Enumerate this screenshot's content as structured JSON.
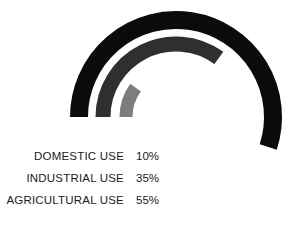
{
  "chart_data": {
    "type": "bar",
    "variant": "radial-bar",
    "title": "",
    "subtitle": "",
    "xlabel": "",
    "ylabel": "",
    "categories": [
      "DOMESTIC USE",
      "INDUSTRIAL USE",
      "AGRICULTURAL USE"
    ],
    "values": [
      10,
      35,
      55
    ],
    "value_labels": [
      "10%",
      "35%",
      "55%"
    ],
    "unit": "%",
    "ylim": [
      0,
      100
    ],
    "grid": false,
    "legend_position": "left",
    "series": [
      {
        "name": "DOMESTIC USE",
        "value": 10,
        "value_label": "10%",
        "color": "#7d7d7d",
        "ring": "inner",
        "radius": 50,
        "thickness": 13,
        "start_angle_deg": 180,
        "sweep_deg": 36
      },
      {
        "name": "INDUSTRIAL USE",
        "value": 35,
        "value_label": "35%",
        "color": "#2f2f2f",
        "ring": "middle",
        "radius": 73,
        "thickness": 15,
        "start_angle_deg": 180,
        "sweep_deg": 126
      },
      {
        "name": "AGRICULTURAL USE",
        "value": 55,
        "value_label": "55%",
        "color": "#0b0b0b",
        "ring": "outer",
        "radius": 97,
        "thickness": 18,
        "start_angle_deg": 180,
        "sweep_deg": 198
      }
    ],
    "center": {
      "x": 176,
      "y": 117
    },
    "direction": "clockwise",
    "background": "#ffffff"
  },
  "legend": {
    "rows": [
      {
        "label": "DOMESTIC USE",
        "value": "10%",
        "color": "#7d7d7d"
      },
      {
        "label": "INDUSTRIAL USE",
        "value": "35%",
        "color": "#2f2f2f"
      },
      {
        "label": "AGRICULTURAL USE",
        "value": "55%",
        "color": "#0b0b0b"
      }
    ]
  },
  "colors": {
    "background": "#ffffff",
    "text": "#1b1b1b",
    "domestic": "#7d7d7d",
    "industrial": "#2f2f2f",
    "agricultural": "#0b0b0b"
  }
}
